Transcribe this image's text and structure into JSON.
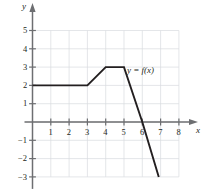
{
  "chart_data": {
    "type": "line",
    "title": "",
    "xlabel": "x",
    "ylabel": "y",
    "curve_label": "y = f(x)",
    "grid": true,
    "legend_position": "inline-annotation",
    "xlim": [
      0,
      8
    ],
    "ylim": [
      -3,
      5
    ],
    "x_ticks": [
      1,
      2,
      3,
      4,
      5,
      6,
      7,
      8
    ],
    "x_tick_labels": [
      "1",
      "2",
      "3",
      "4",
      "5",
      "6",
      "7",
      "8"
    ],
    "y_ticks": [
      5,
      4,
      3,
      2,
      1,
      -1,
      -2,
      -3
    ],
    "y_tick_labels": [
      "5",
      "4",
      "3",
      "2",
      "1",
      "−1",
      "−2",
      "−3"
    ],
    "series": [
      {
        "name": "y = f(x)",
        "points": [
          {
            "x": 0,
            "y": 2
          },
          {
            "x": 3,
            "y": 2
          },
          {
            "x": 4,
            "y": 3
          },
          {
            "x": 5,
            "y": 3
          },
          {
            "x": 6,
            "y": 0
          },
          {
            "x": 6.9,
            "y": -3
          }
        ]
      }
    ],
    "colors": {
      "curve": "#231f20",
      "axis": "#6d6e71",
      "grid": "#d9dbe0",
      "text": "#231f20"
    }
  },
  "annotations": {
    "curve_label": "y = f(x)",
    "y_axis_label": "y",
    "x_axis_label": "x"
  }
}
